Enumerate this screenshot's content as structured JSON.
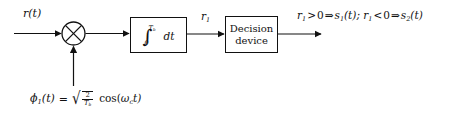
{
  "diagram": {
    "input_label": "r(t)",
    "multiplier": {
      "name": "multiplier",
      "symbol": "x-cross"
    },
    "integrator": {
      "integral_sign": "∫",
      "lower_limit": "0",
      "upper_limit_base": "T",
      "upper_limit_sub": "b",
      "differential": "dt"
    },
    "intermediate_label_base": "r",
    "intermediate_label_sub": "1",
    "decision_block": {
      "line1": "Decision",
      "line2": "device"
    },
    "output_expression": {
      "full": "r₁ > 0 ⇒ s₁(t);  r₁ < 0 ⇒ s₂(t)",
      "parts": {
        "var1": "r",
        "sub1": "1",
        "gt": ">",
        "zero": "0",
        "implies": "⇒",
        "sig1": "s",
        "sig1sub": "1",
        "of_t": "(t);",
        "var2": "r",
        "sub2": "1",
        "lt": "<",
        "zero2": "0",
        "implies2": "⇒",
        "sig2": "s",
        "sig2sub": "2",
        "of_t2": "(t)"
      }
    },
    "carrier": {
      "phi": "ϕ",
      "phi_sub": "1",
      "phi_arg": "(t)",
      "equals": "=",
      "radical": "√",
      "fraction_numerator": "2",
      "fraction_denominator_base": "T",
      "fraction_denominator_sub": "b",
      "cosine": "cos(",
      "omega": "ω",
      "omega_sub": "c",
      "cos_arg_t": "t)"
    }
  },
  "colors": {
    "background": "#ffffff",
    "stroke": "#111111",
    "text": "#111111"
  }
}
